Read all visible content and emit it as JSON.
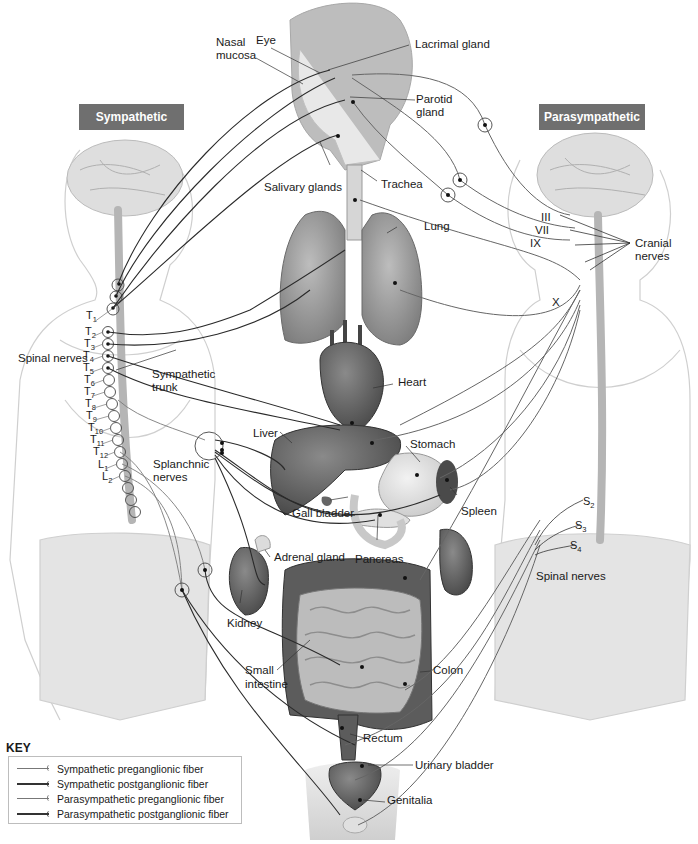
{
  "headers": {
    "sympathetic": "Sympathetic",
    "parasympathetic": "Parasympathetic"
  },
  "labels": {
    "nasal_mucosa_1": "Nasal",
    "nasal_mucosa_2": "mucosa",
    "eye": "Eye",
    "lacrimal_gland": "Lacrimal gland",
    "parotid_gland_1": "Parotid",
    "parotid_gland_2": "gland",
    "salivary_glands": "Salivary glands",
    "trachea": "Trachea",
    "lung": "Lung",
    "heart": "Heart",
    "liver": "Liver",
    "stomach": "Stomach",
    "spleen": "Spleen",
    "gall_bladder": "Gall bladder",
    "pancreas": "Pancreas",
    "adrenal_gland": "Adrenal gland",
    "kidney": "Kidney",
    "small_intestine_1": "Small",
    "small_intestine_2": "intestine",
    "colon": "Colon",
    "rectum": "Rectum",
    "urinary_bladder": "Urinary bladder",
    "genitalia": "Genitalia",
    "spinal_nerves_left": "Spinal nerves",
    "sympathetic_trunk_1": "Sympathetic",
    "sympathetic_trunk_2": "trunk",
    "splanchnic_nerves_1": "Splanchnic",
    "splanchnic_nerves_2": "nerves",
    "cranial_nerves_1": "Cranial",
    "cranial_nerves_2": "nerves",
    "spinal_nerves_right": "Spinal nerves"
  },
  "cranial_nerve_numbers": [
    "III",
    "VII",
    "IX",
    "X"
  ],
  "spinal_segments_left": [
    {
      "letter": "T",
      "num": "1"
    },
    {
      "letter": "T",
      "num": "2"
    },
    {
      "letter": "T",
      "num": "3"
    },
    {
      "letter": "T",
      "num": "4"
    },
    {
      "letter": "T",
      "num": "5"
    },
    {
      "letter": "T",
      "num": "6"
    },
    {
      "letter": "T",
      "num": "7"
    },
    {
      "letter": "T",
      "num": "8"
    },
    {
      "letter": "T",
      "num": "9"
    },
    {
      "letter": "T",
      "num": "10"
    },
    {
      "letter": "T",
      "num": "11"
    },
    {
      "letter": "T",
      "num": "12"
    },
    {
      "letter": "L",
      "num": "1"
    },
    {
      "letter": "L",
      "num": "2"
    }
  ],
  "spinal_segments_right": [
    {
      "letter": "S",
      "num": "2"
    },
    {
      "letter": "S",
      "num": "3"
    },
    {
      "letter": "S",
      "num": "4"
    }
  ],
  "key": {
    "title": "KEY",
    "items": [
      {
        "label": "Sympathetic preganglionic fiber"
      },
      {
        "label": "Sympathetic postganglionic fiber"
      },
      {
        "label": "Parasympathetic preganglionic fiber"
      },
      {
        "label": "Parasympathetic postganglionic fiber"
      }
    ]
  },
  "colors": {
    "header_bg": "#6f6f6f",
    "fiber_dark": "#333333",
    "fiber_light": "#777777",
    "organ_dark": "#5a5a5a",
    "organ_light": "#bdbdbd",
    "body_outline": "#d0d0d0"
  }
}
